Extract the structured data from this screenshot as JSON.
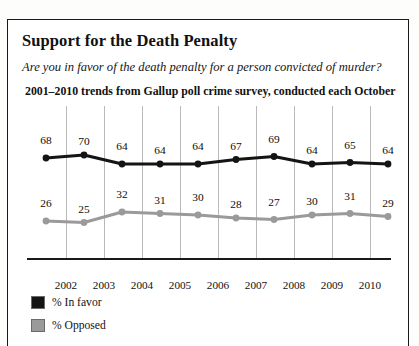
{
  "figure": {
    "title": "Support for the Death Penalty",
    "question": "Are you in favor of the death penalty for a person convicted of murder?",
    "source_note": "2001–2010 trends from Gallup poll crime survey, conducted each October"
  },
  "legend": {
    "items": [
      {
        "label": "% In favor",
        "color": "#141414",
        "swatch_name": "legend-swatch-in-favor"
      },
      {
        "label": "% Opposed",
        "color": "#9a9a9a",
        "swatch_name": "legend-swatch-opposed"
      }
    ]
  },
  "chart_data": {
    "type": "line",
    "title": "Support for the Death Penalty",
    "subtitle": "Are you in favor of the death penalty for a person convicted of murder?",
    "annotation": "2001–2010 trends from Gallup poll crime survey, conducted each October",
    "xlabel": "",
    "ylabel": "",
    "x": [
      2001,
      2002,
      2003,
      2004,
      2005,
      2006,
      2007,
      2008,
      2009,
      2010
    ],
    "categories": [
      "2001",
      "2002",
      "2003",
      "2004",
      "2005",
      "2006",
      "2007",
      "2008",
      "2009",
      "2010"
    ],
    "tick_labels": [
      "2002",
      "2003",
      "2004",
      "2005",
      "2006",
      "2007",
      "2008",
      "2009",
      "2010"
    ],
    "ylim": [
      0,
      100
    ],
    "grid": "vertical",
    "legend_position": "bottom-left",
    "series": [
      {
        "name": "% In favor",
        "color": "#141414",
        "values": [
          68,
          70,
          64,
          64,
          64,
          67,
          69,
          64,
          65,
          64
        ]
      },
      {
        "name": "% Opposed",
        "color": "#9a9a9a",
        "values": [
          26,
          25,
          32,
          31,
          30,
          28,
          27,
          30,
          31,
          29
        ]
      }
    ]
  }
}
